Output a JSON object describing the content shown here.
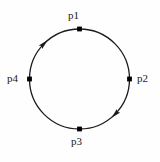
{
  "diagram": {
    "type": "directed-cycle-graph",
    "title": "",
    "background_color": "#fefefe",
    "stroke_color": "#1a1a1a",
    "node_color": "#000000",
    "circle": {
      "center_x": 79.5,
      "center_y": 79,
      "radius": 50,
      "stroke_width": 1.3
    },
    "direction": "clockwise",
    "nodes": [
      {
        "id": "p1",
        "label": "p1",
        "angle_deg": 270,
        "x": 79.5,
        "y": 29,
        "label_position": "above"
      },
      {
        "id": "p2",
        "label": "p2",
        "angle_deg": 0,
        "x": 129.5,
        "y": 79,
        "label_position": "right"
      },
      {
        "id": "p3",
        "label": "p3",
        "angle_deg": 90,
        "x": 79.5,
        "y": 129,
        "label_position": "below"
      },
      {
        "id": "p4",
        "label": "p4",
        "angle_deg": 180,
        "x": 29.5,
        "y": 79,
        "label_position": "left"
      }
    ],
    "arrowheads": [
      {
        "id": "arrow-upper-left",
        "on_arc_from": "p4",
        "on_arc_to": "p1",
        "angle_deg": 225,
        "points": "clockwise"
      },
      {
        "id": "arrow-lower-right",
        "on_arc_from": "p2",
        "on_arc_to": "p3",
        "angle_deg": 45,
        "points": "clockwise"
      }
    ],
    "edges": [
      {
        "from": "p1",
        "to": "p2"
      },
      {
        "from": "p2",
        "to": "p3"
      },
      {
        "from": "p3",
        "to": "p4"
      },
      {
        "from": "p4",
        "to": "p1"
      }
    ]
  }
}
